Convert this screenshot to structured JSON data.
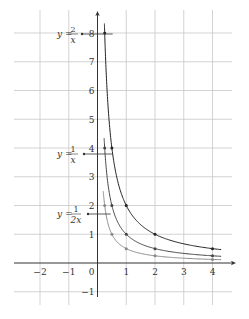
{
  "chart_data": {
    "type": "line",
    "title": "",
    "xlabel": "",
    "ylabel": "",
    "xlim": [
      -2.9,
      4.7
    ],
    "ylim": [
      -1.4,
      8.8
    ],
    "grid": true,
    "x_ticks": [
      -2,
      -1,
      0,
      1,
      2,
      3,
      4
    ],
    "y_ticks": [
      -1,
      1,
      2,
      3,
      4,
      5,
      6,
      7,
      8
    ],
    "x_tick_labels": [
      "−2",
      "−1",
      "0",
      "1",
      "2",
      "3",
      "4"
    ],
    "y_tick_labels": [
      "−1",
      "1",
      "2",
      "3",
      "4",
      "5",
      "6",
      "7",
      "8"
    ],
    "series": [
      {
        "name": "y = 2/x",
        "formula": "2/x",
        "color": "#222222",
        "x_range": [
          0.24,
          4.3
        ],
        "marked_points": [
          [
            0.25,
            8
          ],
          [
            0.5,
            4
          ],
          [
            1,
            2
          ],
          [
            2,
            1
          ],
          [
            4,
            0.5
          ]
        ],
        "label": {
          "prefix": "y =",
          "numerator": "2",
          "denominator": "x"
        }
      },
      {
        "name": "y = 1/x",
        "formula": "1/x",
        "color": "#444444",
        "x_range": [
          0.23,
          4.3
        ],
        "marked_points": [
          [
            0.25,
            4
          ],
          [
            0.5,
            2
          ],
          [
            1,
            1
          ],
          [
            2,
            0.5
          ],
          [
            4,
            0.25
          ]
        ],
        "label": {
          "prefix": "y =",
          "numerator": "1",
          "denominator": "x"
        }
      },
      {
        "name": "y = 1/(2x)",
        "formula": "1/(2x)",
        "color": "#888888",
        "x_range": [
          0.2,
          4.3
        ],
        "marked_points": [
          [
            0.25,
            2
          ],
          [
            0.5,
            1
          ],
          [
            1,
            0.5
          ],
          [
            2,
            0.25
          ],
          [
            4,
            0.125
          ]
        ],
        "label": {
          "prefix": "y =",
          "numerator": "1",
          "denominator": "2x"
        }
      }
    ],
    "annotations": [
      {
        "text": "y = 2/x",
        "points_to": [
          0.25,
          7.7
        ]
      },
      {
        "text": "y = 1/x",
        "points_to": [
          0.25,
          3.6
        ]
      },
      {
        "text": "y = 1/(2x)",
        "points_to": [
          0.25,
          1.7
        ]
      }
    ]
  }
}
